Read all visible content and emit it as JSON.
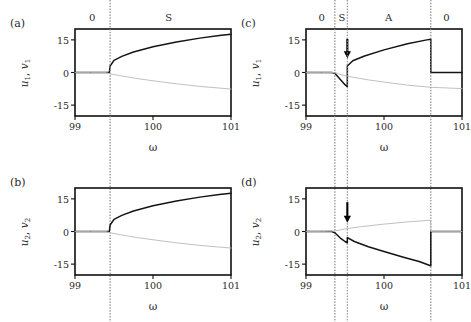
{
  "figure": {
    "background": "#ffffff",
    "curve_color_stable": "#141414",
    "curve_color_unstable": "#b9b9b9",
    "frame_color": "#101010",
    "dotted_color": "#9a9a9a",
    "arrow_color": "#000000"
  },
  "axes": {
    "xlabel": "ω",
    "xticks": [
      "99",
      "100",
      "101"
    ],
    "xtickvals": [
      99,
      100,
      101
    ],
    "xlim": [
      99,
      101
    ],
    "yticks": [
      "15",
      "0",
      "-15"
    ],
    "ytickvals": [
      15,
      0,
      -15
    ],
    "ylim": [
      -20,
      20
    ]
  },
  "panels": [
    {
      "tag": "(a)",
      "ylabel": "u₁, v₁",
      "ylabel_parts": {
        "u": "u",
        "usub": "1",
        "sep": ", ",
        "v": "v",
        "vsub": "1"
      },
      "regions": [
        {
          "label": "0",
          "x": 99.22
        },
        {
          "label": "S",
          "x": 100.2
        }
      ],
      "dotted_lines": [
        99.45
      ],
      "arrows": []
    },
    {
      "tag": "(b)",
      "ylabel": "u₂, v₂",
      "ylabel_parts": {
        "u": "u",
        "usub": "2",
        "sep": ", ",
        "v": "v",
        "vsub": "2"
      },
      "regions": [],
      "dotted_lines": [
        99.45
      ],
      "arrows": []
    },
    {
      "tag": "(c)",
      "ylabel": "u₁, v₁",
      "ylabel_parts": {
        "u": "u",
        "usub": "1",
        "sep": ", ",
        "v": "v",
        "vsub": "1"
      },
      "regions": [
        {
          "label": "0",
          "x": 99.2
        },
        {
          "label": "S",
          "x": 99.46
        },
        {
          "label": "A",
          "x": 100.06
        },
        {
          "label": "0",
          "x": 100.8
        }
      ],
      "dotted_lines": [
        99.37,
        99.53,
        100.6
      ],
      "arrows": [
        {
          "x": 99.53,
          "y_from": 15.5,
          "y_to": 6.5
        }
      ]
    },
    {
      "tag": "(d)",
      "ylabel": "u₂, v₂",
      "ylabel_parts": {
        "u": "u",
        "usub": "2",
        "sep": ", ",
        "v": "v",
        "vsub": "2"
      },
      "regions": [],
      "dotted_lines": [
        99.37,
        99.53,
        100.6
      ],
      "arrows": [
        {
          "x": 99.53,
          "y_from": 13.5,
          "y_to": 4.0
        }
      ]
    }
  ],
  "chart_data": [
    {
      "type": "line",
      "panel": "(a)",
      "title": "",
      "xlabel": "ω",
      "ylabel": "u_1, v_1",
      "xlim": [
        99,
        101
      ],
      "ylim": [
        -20,
        20
      ],
      "grid": false,
      "legend": null,
      "annotations": [
        {
          "type": "region-label",
          "text": "0",
          "x": 99.22
        },
        {
          "type": "region-label",
          "text": "S",
          "x": 100.2
        },
        {
          "type": "vline",
          "style": "dotted",
          "x": 99.45
        }
      ],
      "series": [
        {
          "name": "stable-branch",
          "style": "solid-dark",
          "x": [
            99.0,
            99.2,
            99.35,
            99.44,
            99.45,
            99.5,
            99.6,
            99.75,
            100.0,
            100.3,
            100.6,
            100.85,
            101.0
          ],
          "y": [
            0.0,
            0.0,
            0.0,
            0.0,
            3.0,
            5.6,
            7.4,
            9.4,
            11.8,
            14.0,
            15.8,
            17.0,
            17.6
          ]
        },
        {
          "name": "unstable-branch",
          "style": "solid-light",
          "x": [
            99.0,
            99.2,
            99.4,
            99.45,
            99.6,
            99.8,
            100.0,
            100.3,
            100.6,
            101.0
          ],
          "y": [
            0.0,
            0.0,
            0.0,
            -0.6,
            -1.6,
            -2.8,
            -3.8,
            -5.2,
            -6.4,
            -7.6
          ]
        }
      ]
    },
    {
      "type": "line",
      "panel": "(b)",
      "title": "",
      "xlabel": "ω",
      "ylabel": "u_2, v_2",
      "xlim": [
        99,
        101
      ],
      "ylim": [
        -20,
        20
      ],
      "grid": false,
      "legend": null,
      "annotations": [
        {
          "type": "vline",
          "style": "dotted",
          "x": 99.45
        }
      ],
      "series": [
        {
          "name": "stable-branch",
          "style": "solid-dark",
          "x": [
            99.0,
            99.2,
            99.35,
            99.44,
            99.45,
            99.5,
            99.6,
            99.75,
            100.0,
            100.3,
            100.6,
            100.85,
            101.0
          ],
          "y": [
            0.0,
            0.0,
            0.0,
            0.0,
            3.0,
            5.6,
            7.4,
            9.4,
            11.8,
            14.0,
            15.8,
            17.0,
            17.6
          ]
        },
        {
          "name": "unstable-branch",
          "style": "solid-light",
          "x": [
            99.0,
            99.2,
            99.4,
            99.45,
            99.6,
            99.8,
            100.0,
            100.3,
            100.6,
            101.0
          ],
          "y": [
            0.0,
            0.0,
            0.0,
            -0.6,
            -1.6,
            -2.8,
            -3.8,
            -5.2,
            -6.4,
            -7.6
          ]
        }
      ]
    },
    {
      "type": "line",
      "panel": "(c)",
      "title": "",
      "xlabel": "ω",
      "ylabel": "u_1, v_1",
      "xlim": [
        99,
        101
      ],
      "ylim": [
        -20,
        20
      ],
      "grid": false,
      "legend": null,
      "annotations": [
        {
          "type": "region-label",
          "text": "0",
          "x": 99.2
        },
        {
          "type": "region-label",
          "text": "S",
          "x": 99.46
        },
        {
          "type": "region-label",
          "text": "A",
          "x": 100.06
        },
        {
          "type": "region-label",
          "text": "0",
          "x": 100.8
        },
        {
          "type": "vline",
          "style": "dotted",
          "x": 99.37
        },
        {
          "type": "vline",
          "style": "dotted",
          "x": 99.53
        },
        {
          "type": "vline",
          "style": "dotted",
          "x": 100.6
        },
        {
          "type": "arrow",
          "x": 99.53,
          "y_from": 15.5,
          "y_to": 6.5
        }
      ],
      "series": [
        {
          "name": "stable-branch",
          "style": "solid-dark",
          "x": [
            99.0,
            99.2,
            99.33,
            99.37,
            99.44,
            99.5,
            99.53,
            99.53,
            99.6,
            99.75,
            100.0,
            100.3,
            100.55,
            100.6,
            100.6,
            100.8,
            101.0
          ],
          "y": [
            0.0,
            0.0,
            0.0,
            -0.4,
            -3.2,
            -5.6,
            -6.5,
            3.0,
            5.4,
            7.6,
            10.4,
            13.2,
            15.0,
            15.3,
            0.0,
            0.0,
            0.0
          ]
        },
        {
          "name": "unstable-branch",
          "style": "solid-light",
          "x": [
            99.0,
            99.2,
            99.37,
            99.45,
            99.6,
            99.8,
            100.0,
            100.3,
            100.6,
            101.0
          ],
          "y": [
            0.0,
            0.0,
            0.0,
            -1.0,
            -2.2,
            -3.4,
            -4.4,
            -5.8,
            -6.8,
            -7.4
          ]
        }
      ]
    },
    {
      "type": "line",
      "panel": "(d)",
      "title": "",
      "xlabel": "ω",
      "ylabel": "u_2, v_2",
      "xlim": [
        99,
        101
      ],
      "ylim": [
        -20,
        20
      ],
      "grid": false,
      "legend": null,
      "annotations": [
        {
          "type": "vline",
          "style": "dotted",
          "x": 99.37
        },
        {
          "type": "vline",
          "style": "dotted",
          "x": 99.53
        },
        {
          "type": "vline",
          "style": "dotted",
          "x": 100.6
        },
        {
          "type": "arrow",
          "x": 99.53,
          "y_from": 13.5,
          "y_to": 4.0
        }
      ],
      "series": [
        {
          "name": "stable-branch",
          "style": "solid-dark",
          "x": [
            99.0,
            99.2,
            99.33,
            99.37,
            99.44,
            99.5,
            99.53,
            99.53,
            99.62,
            99.8,
            100.0,
            100.25,
            100.45,
            100.58,
            100.6,
            100.6,
            100.8,
            101.0
          ],
          "y": [
            0.0,
            0.0,
            0.0,
            -0.6,
            -3.0,
            -4.6,
            -5.2,
            -2.8,
            -4.6,
            -7.0,
            -9.2,
            -11.8,
            -13.8,
            -15.5,
            -15.8,
            0.0,
            0.0,
            0.0
          ]
        },
        {
          "name": "unstable-branch",
          "style": "solid-light",
          "x": [
            99.0,
            99.2,
            99.37,
            99.5,
            99.7,
            100.0,
            100.3,
            100.6,
            100.6,
            101.0
          ],
          "y": [
            0.0,
            0.0,
            0.2,
            1.2,
            2.2,
            3.4,
            4.4,
            5.2,
            0.0,
            0.0
          ]
        }
      ]
    }
  ]
}
